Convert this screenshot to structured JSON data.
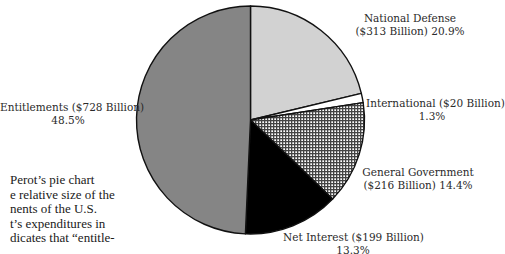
{
  "chart_data": {
    "type": "pie",
    "title": "",
    "start_angle": "12 o'clock, clockwise",
    "slices": [
      {
        "label": "National Defense",
        "amount": "$313 Billion",
        "value": 313,
        "percent": 20.9,
        "fill": "#d2d2d2",
        "pattern": "solid-light-gray"
      },
      {
        "label": "International",
        "amount": "$20 Billion",
        "value": 20,
        "percent": 1.3,
        "fill": "#ffffff",
        "pattern": "solid-white"
      },
      {
        "label": "General Government",
        "amount": "$216 Billion",
        "value": 216,
        "percent": 14.4,
        "fill": "#9a9a9a",
        "pattern": "crosshatch-grid"
      },
      {
        "label": "Net Interest",
        "amount": "$199 Billion",
        "value": 199,
        "percent": 13.3,
        "fill": "#000000",
        "pattern": "solid-black"
      },
      {
        "label": "Entitlements",
        "amount": "$728 Billion",
        "value": 728,
        "percent": 48.5,
        "fill": "#858585",
        "pattern": "solid-mid-gray"
      }
    ],
    "total_billion": 1476
  },
  "labels": {
    "national_defense": {
      "line1": "National Defense",
      "line2": "($313 Billion) 20.9%"
    },
    "international": {
      "line1": "International ($20 Billion)",
      "line2": "1.3%"
    },
    "general_government": {
      "line1": "General Government",
      "line2": "($216 Billion) 14.4%"
    },
    "net_interest": {
      "line1": "Net Interest ($199 Billion)",
      "line2": "13.3%"
    },
    "entitlements": {
      "line1": "Entitlements ($728 Billion)",
      "line2": "48.5%"
    }
  },
  "caption": {
    "lines": [
      "Perot’s pie chart",
      "e relative size of the",
      "nents of the U.S.",
      "t’s expenditures in",
      "dicates that “entitle-"
    ]
  }
}
